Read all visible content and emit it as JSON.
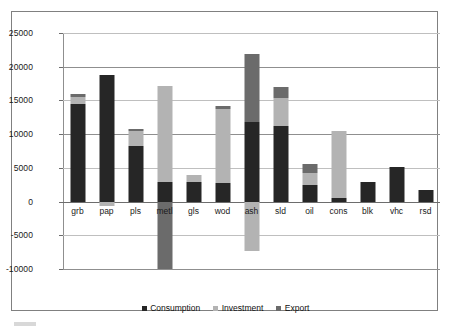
{
  "figure": {
    "background": "#ffffff",
    "frame_color": "#808080"
  },
  "chart_data": {
    "type": "bar",
    "subtype": "stacked-bar-with-negatives",
    "title": "",
    "subtitle": "",
    "xlabel": "",
    "ylabel": "",
    "ylim": [
      -10000,
      25000
    ],
    "yticks": [
      25000,
      20000,
      15000,
      10000,
      5000,
      0,
      -5000,
      -10000
    ],
    "ytick_labels": [
      "25000",
      "20000",
      "15000",
      "10000",
      "5000",
      "0",
      "-5000",
      "-10000"
    ],
    "grid": true,
    "grid_axis": "y",
    "legend_position": "bottom",
    "categories": [
      "grb",
      "pap",
      "pls",
      "metl",
      "gls",
      "wod",
      "ash",
      "sld",
      "oil",
      "cons",
      "blk",
      "vhc",
      "rsd"
    ],
    "series": [
      {
        "name": "Consumption",
        "color": "#262626",
        "values": [
          14450,
          18800,
          8200,
          2900,
          2850,
          2700,
          11800,
          11200,
          2400,
          600,
          2900,
          5150,
          1750
        ]
      },
      {
        "name": "Investment",
        "color": "#b3b3b3",
        "values": [
          1000,
          -650,
          2200,
          14200,
          1150,
          11100,
          -7300,
          4100,
          1800,
          9800,
          0,
          0,
          0
        ]
      },
      {
        "name": "Export",
        "color": "#6b6b6b",
        "values": [
          500,
          0,
          400,
          -10000,
          0,
          300,
          10100,
          1700,
          1300,
          0,
          0,
          0,
          0
        ]
      }
    ],
    "legend_entries": [
      "Consumption",
      "Investment",
      "Export"
    ]
  },
  "legend": {
    "items": [
      {
        "label": "Consumption",
        "color": "#262626"
      },
      {
        "label": "Investment",
        "color": "#b3b3b3"
      },
      {
        "label": "Export",
        "color": "#6b6b6b"
      }
    ]
  }
}
